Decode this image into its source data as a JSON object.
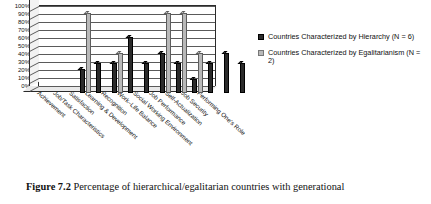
{
  "caption": {
    "label": "Figure 7.2",
    "text": "Percentage of hierarchical/egalitarian countries with generational"
  },
  "legend": {
    "items": [
      {
        "label": "Countries Characterized by Hierarchy (N = 6)",
        "color": "#2b2b2b",
        "swatch": "dark"
      },
      {
        "label": "Countries Characterized by Egalitarianism (N = 2)",
        "color": "#b9b9b9",
        "swatch": "light"
      }
    ]
  },
  "axis": {
    "yticks": [
      "100%",
      "90%",
      "80%",
      "70%",
      "60%",
      "50%",
      "40%",
      "30%",
      "20%",
      "10%",
      "0%"
    ]
  },
  "chart_data": {
    "type": "bar",
    "title": "",
    "xlabel": "",
    "ylabel": "",
    "ylim": [
      0,
      100
    ],
    "grid": true,
    "legend_position": "right",
    "categories": [
      "Achievement",
      "Job/Task Characteristics",
      "Satisfaction",
      "Learning & Development",
      "Recognition",
      "Work–Life Balance",
      "Social Working Environment",
      "Job Performance",
      "Self-Actualization",
      "Job Security",
      "Performing One's Role"
    ],
    "series": [
      {
        "name": "Countries Characterized by Hierarchy (N = 6)",
        "color": "#2b2b2b",
        "values": [
          30,
          38,
          38,
          70,
          38,
          50,
          38,
          17,
          38,
          50,
          38
        ]
      },
      {
        "name": "Countries Characterized by Egalitarianism (N = 2)",
        "color": "#b9b9b9",
        "values": [
          100,
          0,
          50,
          0,
          0,
          100,
          100,
          50,
          0,
          0,
          0
        ]
      }
    ]
  }
}
